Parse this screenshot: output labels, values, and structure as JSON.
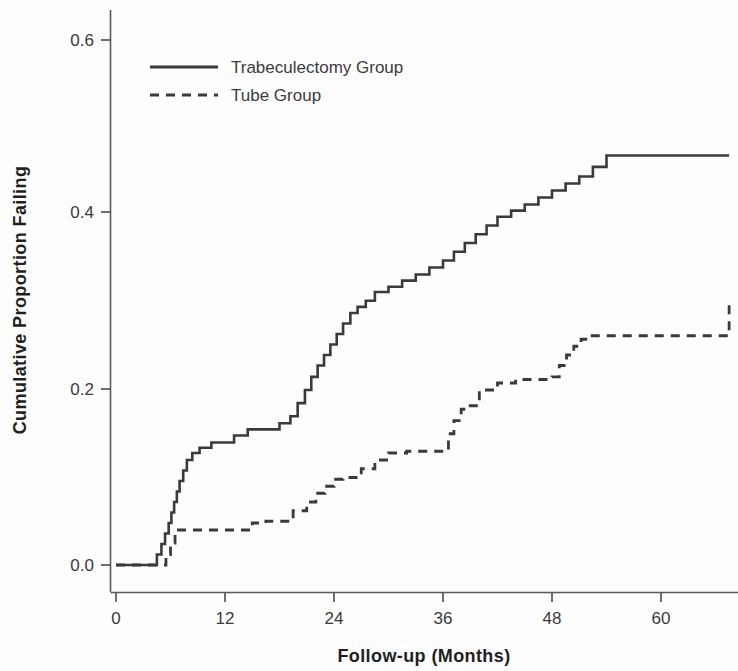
{
  "chart_data": {
    "type": "line",
    "title": "",
    "subtitle": "",
    "xlabel": "Follow-up (Months)",
    "ylabel": "Cumulative Proportion Failing",
    "xlim": [
      -2,
      68
    ],
    "ylim": [
      0.0,
      0.65
    ],
    "xticks": [
      0,
      12,
      24,
      36,
      48,
      60
    ],
    "xtick_labels": [
      "0",
      "12",
      "24",
      "36",
      "48",
      "60"
    ],
    "yticks": [
      0.0,
      0.2,
      0.4,
      0.6
    ],
    "ytick_labels": [
      "0.0",
      "0.2",
      "0.4",
      "0.6"
    ],
    "grid": false,
    "legend_position": "top-left-inside",
    "step_style": "post",
    "line_color": "#3a3a3a",
    "series": [
      {
        "name": "Trabeculectomy Group",
        "style": "solid",
        "x": [
          0,
          4,
          4.5,
          5,
          5.4,
          5.8,
          6.1,
          6.4,
          6.7,
          7.0,
          7.4,
          7.8,
          8.4,
          9.2,
          10.5,
          12.0,
          13.0,
          14.5,
          16.5,
          18.0,
          19.2,
          20.0,
          20.8,
          21.5,
          22.2,
          22.9,
          23.6,
          24.3,
          25.0,
          25.8,
          26.6,
          27.5,
          28.5,
          30.0,
          31.5,
          33.0,
          34.5,
          36.0,
          37.2,
          38.4,
          39.6,
          40.8,
          42.0,
          43.5,
          45.0,
          46.5,
          48.0,
          49.5,
          51.0,
          52.5,
          54.0,
          67.5
        ],
        "y": [
          0.0,
          0.0,
          0.012,
          0.024,
          0.036,
          0.048,
          0.06,
          0.072,
          0.084,
          0.096,
          0.108,
          0.12,
          0.128,
          0.134,
          0.14,
          0.14,
          0.148,
          0.155,
          0.155,
          0.162,
          0.17,
          0.185,
          0.2,
          0.215,
          0.228,
          0.24,
          0.252,
          0.264,
          0.276,
          0.288,
          0.295,
          0.302,
          0.312,
          0.318,
          0.325,
          0.332,
          0.34,
          0.348,
          0.358,
          0.368,
          0.378,
          0.388,
          0.398,
          0.405,
          0.412,
          0.42,
          0.428,
          0.436,
          0.444,
          0.455,
          0.468,
          0.468
        ],
        "final_value": 0.47
      },
      {
        "name": "Tube Group",
        "style": "dashed",
        "x": [
          0,
          5.0,
          5.5,
          6.0,
          6.5,
          14.0,
          15.0,
          16.5,
          18.0,
          19.5,
          21.0,
          22.0,
          23.0,
          24.0,
          25.0,
          26.0,
          27.0,
          28.5,
          30.0,
          32.0,
          34.0,
          36.0,
          36.6,
          37.2,
          38.0,
          39.0,
          40.0,
          42.0,
          44.0,
          46.0,
          48.0,
          48.8,
          49.6,
          50.4,
          51.2,
          52.0,
          61.0,
          67.5
        ],
        "y": [
          0.0,
          0.0,
          0.012,
          0.025,
          0.04,
          0.04,
          0.048,
          0.05,
          0.05,
          0.062,
          0.072,
          0.082,
          0.09,
          0.098,
          0.1,
          0.1,
          0.11,
          0.12,
          0.128,
          0.13,
          0.13,
          0.13,
          0.15,
          0.165,
          0.178,
          0.182,
          0.2,
          0.208,
          0.212,
          0.212,
          0.215,
          0.228,
          0.24,
          0.25,
          0.258,
          0.262,
          0.262,
          0.3
        ],
        "final_value": 0.3
      }
    ],
    "annotations": []
  },
  "legend": {
    "entries": [
      {
        "label": "Trabeculectomy Group",
        "style": "solid"
      },
      {
        "label": "Tube Group",
        "style": "dashed"
      }
    ]
  }
}
